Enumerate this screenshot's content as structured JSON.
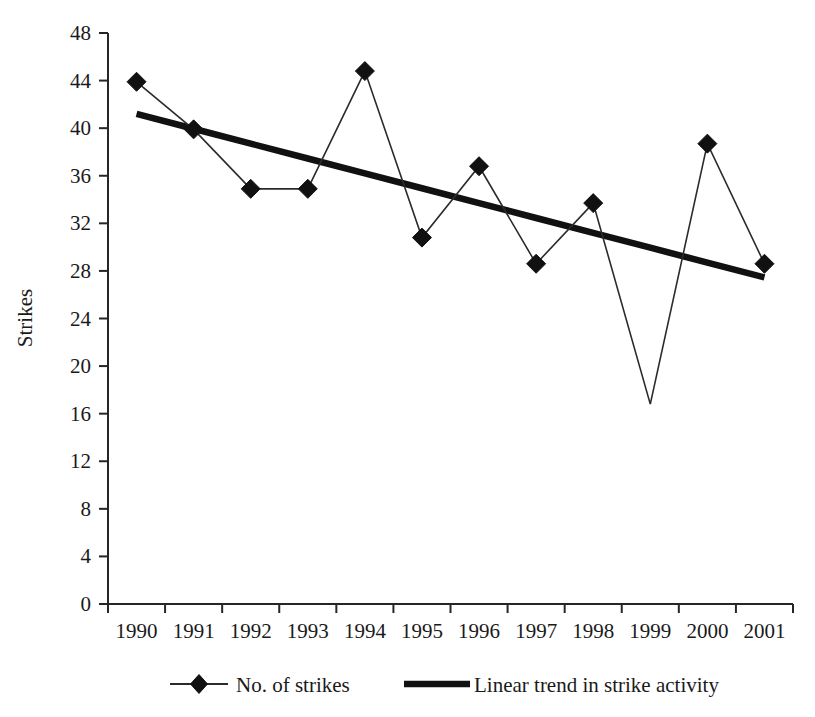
{
  "chart_data": {
    "type": "line",
    "title": "",
    "xlabel": "",
    "ylabel": "Strikes",
    "categories": [
      "1990",
      "1991",
      "1992",
      "1993",
      "1994",
      "1995",
      "1996",
      "1997",
      "1998",
      "1999",
      "2000",
      "2001"
    ],
    "ylim": [
      0,
      48
    ],
    "ytick_step": 4,
    "ytick_labels": [
      "0",
      "4",
      "8",
      "12",
      "16",
      "20",
      "24",
      "28",
      "32",
      "36",
      "40",
      "44",
      "48"
    ],
    "grid": false,
    "legend_position": "bottom",
    "series": [
      {
        "name": "No. of strikes",
        "marker": "diamond",
        "style": "thin-line-with-markers",
        "values": [
          43.9,
          39.9,
          34.9,
          34.9,
          44.8,
          30.8,
          36.8,
          28.6,
          33.7,
          16.8,
          38.7,
          28.6
        ]
      },
      {
        "name": "Linear trend in strike activity",
        "marker": "none",
        "style": "thick-line",
        "values": [
          41.2,
          39.95,
          38.7,
          37.45,
          36.2,
          34.95,
          33.7,
          32.45,
          31.2,
          29.95,
          28.7,
          27.45
        ]
      }
    ],
    "annotations": []
  },
  "legend": {
    "items": [
      {
        "label": "No. of strikes",
        "symbol": "diamond-line"
      },
      {
        "label": "Linear trend in strike activity",
        "symbol": "thick-line"
      }
    ]
  },
  "colors": {
    "series_line": "#2b2b2b",
    "trend_line": "#111111",
    "marker": "#111111",
    "axis": "#262626",
    "text": "#1a1a1a",
    "background": "#ffffff"
  }
}
